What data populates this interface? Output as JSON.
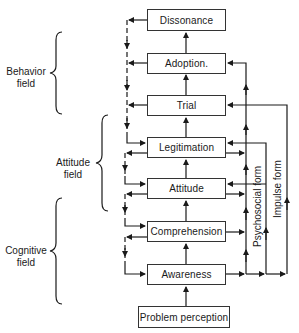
{
  "diagram": {
    "stages": [
      {
        "id": "dissonance",
        "label": "Dissonance"
      },
      {
        "id": "adoption",
        "label": "Adoption."
      },
      {
        "id": "trial",
        "label": "Trial"
      },
      {
        "id": "legitimation",
        "label": "Legitimation"
      },
      {
        "id": "attitude",
        "label": "Attitude"
      },
      {
        "id": "comprehension",
        "label": "Comprehension"
      },
      {
        "id": "awareness",
        "label": "Awareness"
      },
      {
        "id": "problem_perception",
        "label": "Problem perception"
      }
    ],
    "fields": [
      {
        "id": "behavior",
        "line1": "Behavior",
        "line2": "field"
      },
      {
        "id": "attitude",
        "line1": "Attitude",
        "line2": "field"
      },
      {
        "id": "cognitive",
        "line1": "Cognitive",
        "line2": "field"
      }
    ],
    "paths": {
      "psychosocial": "Psychosocial form",
      "impulse": "Impulse form"
    },
    "colors": {
      "line": "#1a1a1a",
      "box_border": "#333333",
      "background": "#ffffff"
    }
  }
}
